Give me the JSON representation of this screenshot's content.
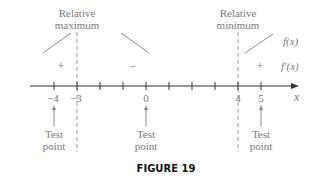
{
  "figure": {
    "caption": "FIGURE 19"
  },
  "labels": {
    "rel_max_line1": "Relative",
    "rel_max_line2": "maximum",
    "rel_min_line1": "Relative",
    "rel_min_line2": "minimum",
    "f_label": "f(x)",
    "fprime_label": "f′(x)",
    "axis_var": "x"
  },
  "signs": {
    "left": "+",
    "middle": "−",
    "right": "+"
  },
  "axis": {
    "ticks": [
      "−4",
      "−3",
      "",
      "",
      "0",
      "",
      "",
      "",
      "4",
      "5"
    ],
    "labeled": [
      {
        "value": "−4",
        "label": "−4"
      },
      {
        "value": "−3",
        "label": "−3"
      },
      {
        "value": "0",
        "label": "0"
      },
      {
        "value": "4",
        "label": "4"
      },
      {
        "value": "5",
        "label": "5"
      }
    ],
    "critical_points": [
      "−3",
      "4"
    ]
  },
  "test_points": [
    {
      "at": "−4",
      "line1": "Test",
      "line2": "point"
    },
    {
      "at": "0",
      "line1": "Test",
      "line2": "point"
    },
    {
      "at": "5",
      "line1": "Test",
      "line2": "point"
    }
  ],
  "colors": {
    "text": "#7a7a7a",
    "lines": "#8a8a8a",
    "axis": "#333333",
    "caption": "#111111"
  }
}
